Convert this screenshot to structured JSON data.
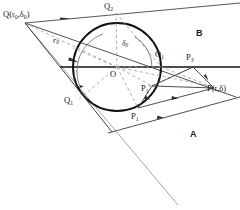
{
  "figure": {
    "canvas": {
      "width": 240,
      "height": 210,
      "background": "#ffffff"
    },
    "colors": {
      "circle_stroke": "#111111",
      "solid_line": "#3a3a3a",
      "dashed_line": "#9a9a9a",
      "axis_line": "#111111",
      "text": "#1a1a1a"
    },
    "labels": {
      "source_point": "Q(r",
      "source_point_sub": "0",
      "source_point_mid": ",δ",
      "source_point_sub2": "0",
      "source_point_end": ")",
      "radius_source": "r",
      "radius_source_sub": "0",
      "angle_delta": "δ",
      "angle_delta_sub": "0",
      "center": "O",
      "center_right": "O",
      "center_right_sub": "1",
      "point_q2": "Q",
      "point_q2_sub": "2",
      "point_q1": "Q",
      "point_q1_sub": "1",
      "point_p1": "P",
      "point_p1_sub": "1",
      "point_p1_prime": "P",
      "point_p1_prime_sub": "1",
      "point_p1_prime_mark": "′",
      "point_p3": "P",
      "point_p3_sub": "3",
      "field_point": "P(r,δ)",
      "region_a": "A",
      "region_b": "B"
    },
    "geometry": {
      "circle": {
        "cx": 117,
        "cy": 67,
        "r": 44
      },
      "center_point": {
        "x": 117,
        "y": 67
      },
      "source": {
        "x": 25,
        "y": 23
      },
      "q2": {
        "x": 116,
        "y": 13
      },
      "q1": {
        "x": 77,
        "y": 101
      },
      "p1": {
        "x": 138,
        "y": 108
      },
      "p1_prime": {
        "x": 152,
        "y": 86
      },
      "p3": {
        "x": 193,
        "y": 67
      },
      "field": {
        "x": 210,
        "y": 86
      },
      "o1": {
        "x": 161,
        "y": 67
      }
    }
  }
}
